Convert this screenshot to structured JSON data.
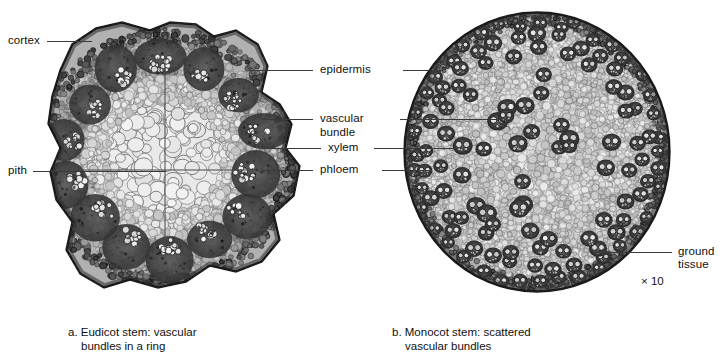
{
  "figure": {
    "background_color": "#ffffff",
    "text_color": "#101010",
    "leader_line_color": "#3a3a3a"
  },
  "labels": {
    "cortex": "cortex",
    "pith": "pith",
    "epidermis": "epidermis",
    "vascular_bundle_line1": "vascular",
    "vascular_bundle_line2": "bundle",
    "xylem": "xylem",
    "phloem": "phloem",
    "ground_tissue_line1": "ground",
    "ground_tissue_line2": "tissue"
  },
  "magnification": {
    "value": "× 10"
  },
  "captions": {
    "panel_a_line1": "a. Eudicot stem: vascular",
    "panel_a_line2": "bundles in a ring",
    "panel_b_line1": "b. Monocot stem: scattered",
    "panel_b_line2": "vascular bundles"
  },
  "panels": [
    {
      "id": "panel-a",
      "name": "eudicot-stem-micrograph",
      "shape": "irregular-polygon",
      "structures": [
        "epidermis",
        "cortex",
        "vascular bundles in a ring",
        "pith"
      ]
    },
    {
      "id": "panel-b",
      "name": "monocot-stem-micrograph",
      "shape": "circle",
      "structures": [
        "epidermis",
        "scattered vascular bundles",
        "ground tissue"
      ]
    }
  ]
}
